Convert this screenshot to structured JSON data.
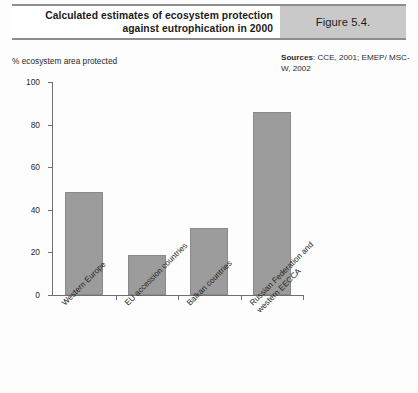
{
  "header": {
    "title": "Calculated estimates of ecosystem protection\nagainst eutrophication in 2000",
    "figure_label": "Figure 5.4.",
    "figure_block_color": "#c9c9c9"
  },
  "sources": {
    "label": "Sources",
    "separator": ": ",
    "text": "CCE, 2001; EMEP/ MSC-W, 2002"
  },
  "chart_data": {
    "type": "bar",
    "title": "Calculated estimates of ecosystem protection against eutrophication in 2000",
    "xlabel": "",
    "ylabel": "% ecosystem area protected",
    "ylim": [
      0,
      100
    ],
    "yticks": [
      0,
      20,
      40,
      60,
      80,
      100
    ],
    "ytick_labels": [
      "0",
      "20",
      "40",
      "60",
      "80",
      "100"
    ],
    "grid": false,
    "legend": "none",
    "bar_color": "#9c9c9c",
    "categories": [
      "Western Europe",
      "EU accession countries",
      "Balkan countries",
      "Russian Federation and\nwestern EECCA"
    ],
    "values": [
      48.5,
      19,
      31.5,
      86
    ]
  }
}
